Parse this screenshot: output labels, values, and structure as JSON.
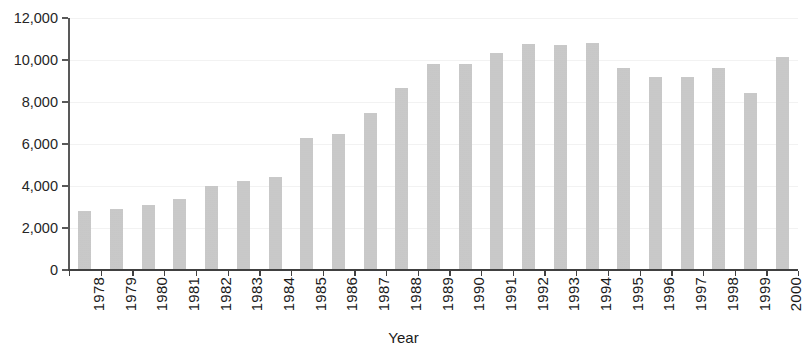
{
  "chart_data": {
    "type": "bar",
    "title": "",
    "xlabel": "Year",
    "ylabel": "",
    "categories": [
      "1978",
      "1979",
      "1980",
      "1981",
      "1982",
      "1983",
      "1984",
      "1985",
      "1986",
      "1987",
      "1988",
      "1989",
      "1990",
      "1991",
      "1992",
      "1993",
      "1994",
      "1995",
      "1996",
      "1997",
      "1998",
      "1999",
      "2000"
    ],
    "values": [
      2800,
      2900,
      3100,
      3400,
      4000,
      4250,
      4450,
      6300,
      6500,
      7500,
      8650,
      9800,
      9800,
      10350,
      10750,
      10700,
      10800,
      9600,
      9200,
      9200,
      9600,
      8450,
      10150
    ],
    "ytick_labels": [
      "12,000",
      "10,000",
      "8,000",
      "6,000",
      "4,000",
      "2,000",
      "0"
    ],
    "ytick_values": [
      12000,
      10000,
      8000,
      6000,
      4000,
      2000,
      0
    ],
    "ylim": [
      0,
      12000
    ],
    "grid": true,
    "legend": false,
    "bar_color": "#c2c2c2",
    "axis_color": "#404040",
    "gridline_color": "#f2f2f2",
    "text_color": "#1a1a1a"
  }
}
